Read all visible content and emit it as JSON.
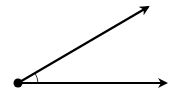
{
  "diagram": {
    "type": "angle",
    "vertex": {
      "x": 18,
      "y": 83
    },
    "rays": [
      {
        "name": "upper-ray",
        "to": {
          "x": 150,
          "y": 5
        }
      },
      {
        "name": "lower-ray",
        "to": {
          "x": 168,
          "y": 83
        }
      }
    ],
    "angle_marker": "arc",
    "stroke_color": "#000000",
    "background_color": "#ffffff"
  }
}
